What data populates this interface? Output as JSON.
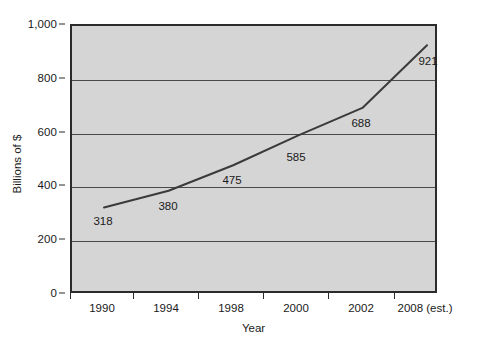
{
  "chart_data": {
    "type": "line",
    "title": "",
    "xlabel": "Year",
    "ylabel": "Billions of $",
    "categories": [
      "1990",
      "1994",
      "1998",
      "2000",
      "2002",
      "2008 (est.)"
    ],
    "values": [
      318,
      380,
      475,
      585,
      688,
      921
    ],
    "point_labels": [
      "318",
      "380",
      "475",
      "585",
      "688",
      "921"
    ],
    "ylim": [
      0,
      1000
    ],
    "yticks": [
      0,
      200,
      400,
      600,
      800,
      1000
    ],
    "ytick_labels": [
      "0",
      "200",
      "400",
      "600",
      "800",
      "1,000"
    ],
    "grid": "horizontal",
    "legend": "none",
    "series": [
      {
        "name": "Billions of $",
        "values": [
          318,
          380,
          475,
          585,
          688,
          921
        ]
      }
    ]
  },
  "style": {
    "plot_background": "#d5d5d5",
    "line_color": "#3a3a3a",
    "gridline_color": "#4a4a4a",
    "axis_color": "#2b2b2b",
    "text_color": "#1a1a1a",
    "page_background": "#ffffff"
  }
}
